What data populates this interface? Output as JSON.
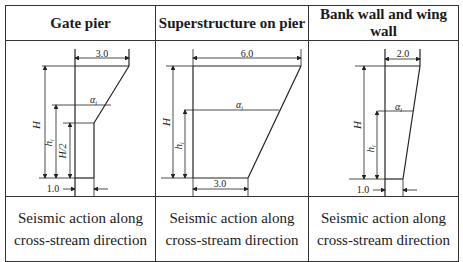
{
  "table": {
    "headers": [
      "Gate pier",
      "Superstructure on pier",
      "Bank wall and wing wall"
    ],
    "captions": [
      "Seismic action along cross-stream direction",
      "Seismic action along cross-stream direction",
      "Seismic action along cross-stream direction"
    ]
  },
  "diagrams": {
    "gate_pier": {
      "top_width": "3.0",
      "bottom_width": "1.0",
      "height_label": "H",
      "hi_label": "h_i",
      "half_height_label": "H/2",
      "alpha_label": "α_i"
    },
    "superstructure": {
      "top_width": "6.0",
      "bottom_width": "3.0",
      "height_label": "H",
      "hi_label": "h_i",
      "alpha_label": "α_i"
    },
    "bank_wall": {
      "top_width": "2.0",
      "bottom_width": "1.0",
      "height_label": "H",
      "hi_label": "h_i",
      "alpha_label": "α_i"
    }
  }
}
